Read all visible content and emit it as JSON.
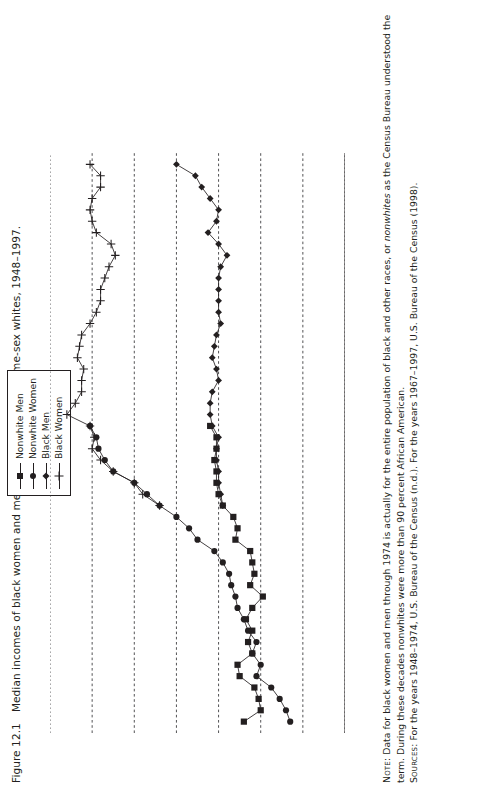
{
  "figure": {
    "number": "Figure 12.1",
    "caption": "Median incomes of black women and men as a proportion of same-sex whites, 1948–1997."
  },
  "legend": {
    "position": "top-center",
    "items": [
      {
        "label": "Nonwhite Men",
        "marker": "filled-square"
      },
      {
        "label": "Nonwhite Women",
        "marker": "filled-circle"
      },
      {
        "label": "Black Men",
        "marker": "filled-diamond"
      },
      {
        "label": "Black Women",
        "marker": "plus-cross"
      }
    ]
  },
  "notes": {
    "note_label": "Note:",
    "note_text": " Data for black women and men through 1974 is actually for the entire population of black and other races, or nonwhites as the Census Bureau understood the term. During these decades nonwhites were more than 90 percent African American.",
    "note_italic_word": "nonwhites",
    "sources_label": "Sources:",
    "sources_text": " For the years 1948–1974, U.S. Bureau of the Census (n.d.). For the years 1967–1997, U.S. Bureau of the Census (1998)."
  },
  "chart_data": {
    "type": "line",
    "title": "Median incomes of black women and men as a proportion of same-sex whites, 1948–1997.",
    "xlabel": "",
    "ylabel": "",
    "orientation": "rotated-90",
    "grid": true,
    "xlim": [
      1947,
      1998
    ],
    "ylim": [
      0.3,
      1.0
    ],
    "ytick_labels": [
      "0.3",
      "0.4",
      "0.5",
      "0.6",
      "0.7",
      "0.8",
      "0.9",
      "1"
    ],
    "ytick_values": [
      0.3,
      0.4,
      0.5,
      0.6,
      0.7,
      0.8,
      0.9,
      1.0
    ],
    "xtick_labels": [
      "1948",
      "1951",
      "1954",
      "1957",
      "1960",
      "1963",
      "1966",
      "1969",
      "1972",
      "1975",
      "1978",
      "1981",
      "1984",
      "1987",
      "1990",
      "1993",
      "1996"
    ],
    "xtick_values": [
      1948,
      1951,
      1954,
      1957,
      1960,
      1963,
      1966,
      1969,
      1972,
      1975,
      1978,
      1981,
      1984,
      1987,
      1990,
      1993,
      1996
    ],
    "xtick_minor_step": 1,
    "series": [
      {
        "name": "Nonwhite Men",
        "marker": "filled-square",
        "x": [
          1948,
          1949,
          1950,
          1951,
          1952,
          1953,
          1954,
          1955,
          1956,
          1957,
          1958,
          1959,
          1960,
          1961,
          1962,
          1963,
          1964,
          1965,
          1966,
          1967,
          1968,
          1969,
          1970,
          1971,
          1972,
          1973,
          1974
        ],
        "y": [
          0.54,
          0.5,
          0.505,
          0.515,
          0.55,
          0.555,
          0.52,
          0.53,
          0.52,
          0.535,
          0.52,
          0.495,
          0.525,
          0.515,
          0.52,
          0.525,
          0.56,
          0.555,
          0.565,
          0.59,
          0.6,
          0.605,
          0.605,
          0.61,
          0.605,
          0.605,
          0.62
        ]
      },
      {
        "name": "Nonwhite Women",
        "marker": "filled-circle",
        "x": [
          1948,
          1949,
          1950,
          1951,
          1952,
          1953,
          1954,
          1955,
          1956,
          1957,
          1958,
          1959,
          1960,
          1961,
          1962,
          1963,
          1964,
          1965,
          1966,
          1967,
          1968,
          1969,
          1970,
          1971,
          1972,
          1973,
          1974
        ],
        "y": [
          0.43,
          0.44,
          0.455,
          0.475,
          0.51,
          0.5,
          0.52,
          0.51,
          0.53,
          0.54,
          0.555,
          0.56,
          0.57,
          0.575,
          0.59,
          0.61,
          0.65,
          0.67,
          0.7,
          0.74,
          0.77,
          0.8,
          0.85,
          0.87,
          0.885,
          0.89,
          0.905
        ]
      },
      {
        "name": "Black Men",
        "marker": "filled-diamond",
        "x": [
          1967,
          1968,
          1969,
          1970,
          1971,
          1972,
          1973,
          1974,
          1975,
          1976,
          1977,
          1978,
          1979,
          1980,
          1981,
          1982,
          1983,
          1984,
          1985,
          1986,
          1987,
          1988,
          1989,
          1990,
          1991,
          1992,
          1993,
          1994,
          1995,
          1996,
          1997
        ],
        "y": [
          0.59,
          0.595,
          0.6,
          0.6,
          0.605,
          0.605,
          0.6,
          0.615,
          0.62,
          0.62,
          0.615,
          0.6,
          0.605,
          0.615,
          0.61,
          0.605,
          0.595,
          0.6,
          0.6,
          0.6,
          0.6,
          0.595,
          0.58,
          0.6,
          0.625,
          0.605,
          0.6,
          0.62,
          0.64,
          0.655,
          0.7
        ]
      },
      {
        "name": "Black Women",
        "marker": "plus-cross",
        "x": [
          1967,
          1968,
          1969,
          1970,
          1971,
          1972,
          1973,
          1974,
          1975,
          1976,
          1977,
          1978,
          1979,
          1980,
          1981,
          1982,
          1983,
          1984,
          1985,
          1986,
          1987,
          1988,
          1989,
          1990,
          1991,
          1992,
          1993,
          1994,
          1995,
          1996,
          1997
        ],
        "y": [
          0.74,
          0.78,
          0.8,
          0.85,
          0.88,
          0.9,
          0.895,
          0.905,
          0.96,
          0.94,
          0.925,
          0.925,
          0.92,
          0.935,
          0.93,
          0.925,
          0.905,
          0.89,
          0.88,
          0.88,
          0.87,
          0.86,
          0.845,
          0.855,
          0.89,
          0.9,
          0.905,
          0.9,
          0.88,
          0.88,
          0.905
        ]
      }
    ]
  }
}
